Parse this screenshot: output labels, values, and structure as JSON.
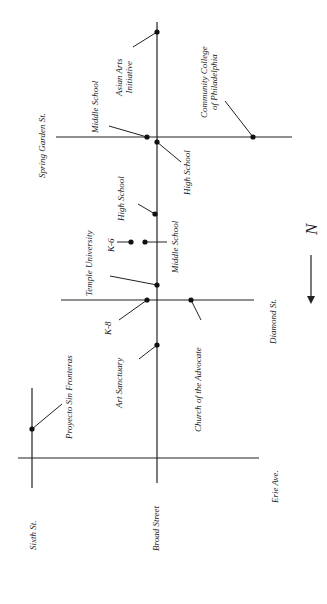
{
  "map": {
    "streets": [
      {
        "id": "sixth",
        "name": "Sixth St.",
        "orientation": "vertical"
      },
      {
        "id": "broad",
        "name": "Broad Street",
        "orientation": "vertical"
      },
      {
        "id": "spring-garden",
        "name": "Spring Garden St.",
        "orientation": "horizontal"
      },
      {
        "id": "diamond",
        "name": "Diamond St.",
        "orientation": "horizontal"
      },
      {
        "id": "erie",
        "name": "Erie Ave."
      }
    ],
    "landmarks": [
      {
        "id": "asian-arts",
        "name_line1": "Asian Arts",
        "name_line2": "Initiative"
      },
      {
        "id": "middle-school-sg",
        "name": "Middle School"
      },
      {
        "id": "community-college",
        "name_line1": "Community College",
        "name_line2": "of Philadelphia"
      },
      {
        "id": "high-school-sg",
        "name": "High School"
      },
      {
        "id": "high-school-2",
        "name": "High School"
      },
      {
        "id": "k6",
        "name": "K-6"
      },
      {
        "id": "middle-school-2",
        "name": "Middle School"
      },
      {
        "id": "temple",
        "name": "Temple University"
      },
      {
        "id": "k8",
        "name": "K-8"
      },
      {
        "id": "church",
        "name": "Church of the Advocate"
      },
      {
        "id": "art-sanctuary",
        "name": "Art Sanctuary"
      },
      {
        "id": "proyecto",
        "name": "Proyecto Sin Fronteras"
      }
    ],
    "compass": {
      "label": "N",
      "direction": "down"
    },
    "colors": {
      "line": "#222222",
      "text": "#222222",
      "background": "#ffffff"
    }
  }
}
